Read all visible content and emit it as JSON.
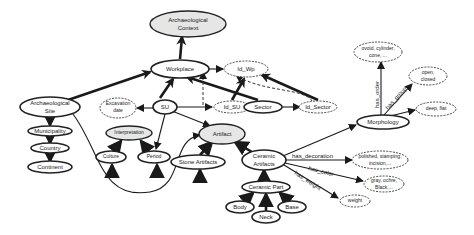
{
  "diagram": {
    "nodes": {
      "arch_context": {
        "line1": "Archaeological",
        "line2": "Context"
      },
      "workplace": {
        "label": "Workplace"
      },
      "id_wp": {
        "label": "Id_Wp"
      },
      "su": {
        "label": "SU"
      },
      "excavation_date": {
        "line1": "Excavation",
        "line2": "date"
      },
      "id_su": {
        "label": "Id_SU"
      },
      "sector": {
        "label": "Sector"
      },
      "id_sector": {
        "label": "Id_Sector"
      },
      "arch_site": {
        "line1": "Archaeological",
        "line2": "Site"
      },
      "municipality": {
        "label": "Municipality"
      },
      "country": {
        "label": "Country"
      },
      "continent": {
        "label": "Continent"
      },
      "interpretation": {
        "label": "Interpretation"
      },
      "culture": {
        "label": "Culture"
      },
      "period": {
        "label": "Period"
      },
      "artifact": {
        "label": "Artifact"
      },
      "stone_artifacts": {
        "label": "Stone Artifacts"
      },
      "ceramic_artifacts": {
        "line1": "Ceramic",
        "line2": "Artifacts"
      },
      "ceramic_part": {
        "label": "Ceramic Part"
      },
      "body": {
        "label": "Body"
      },
      "neck": {
        "label": "Neck"
      },
      "base": {
        "label": "Base"
      },
      "morphology": {
        "label": "Morphology"
      },
      "shape_values": {
        "line1": "ovoid, cylinder,",
        "line2": "cone, ..."
      },
      "open_closed": {
        "line1": "open,",
        "line2": "closed"
      },
      "deep_flat": {
        "label": "deep, flat"
      },
      "decoration_values": {
        "line1": "polished, stamping,",
        "line2": "incision,..."
      },
      "color_values": {
        "line1": "gray, ochre,",
        "line2": "Black,..."
      },
      "weight": {
        "label": "weight"
      }
    },
    "edge_labels": {
      "has_decoration": "has_decoration",
      "has_color": "has_color",
      "has_weight": "has_weight",
      "has_order": "has_order",
      "has_group": "has_group"
    },
    "colors": {
      "stroke": "#1a1a1a",
      "filled_node": "#e6e6e6",
      "background": "#ffffff"
    }
  }
}
